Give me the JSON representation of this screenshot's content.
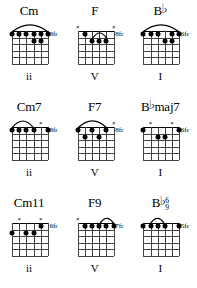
{
  "document": {
    "title": "Guitar chord chart - ii V I progressions in B-flat",
    "strings": 6,
    "frets": 5
  },
  "symbols": {
    "muted": "×",
    "open": "○",
    "flat": "♭",
    "fret_suffix": "fr"
  },
  "rows": [
    {
      "row_name": "triads",
      "chords": [
        {
          "name_root": "Cm",
          "name_flat": "",
          "name_suffix": "",
          "stack_top": "",
          "stack_bottom": "",
          "fret_label": "8fr",
          "numeral": "ii",
          "markers": [],
          "barre": {
            "from_string": 1,
            "to_string": 6,
            "fret": 1
          },
          "dots": [
            {
              "string": 1,
              "fret": 1
            },
            {
              "string": 2,
              "fret": 1
            },
            {
              "string": 3,
              "fret": 1
            },
            {
              "string": 4,
              "fret": 1
            },
            {
              "string": 5,
              "fret": 1
            },
            {
              "string": 6,
              "fret": 1
            },
            {
              "string": 4,
              "fret": 2
            },
            {
              "string": 5,
              "fret": 2
            }
          ]
        },
        {
          "name_root": "F",
          "name_flat": "",
          "name_suffix": "",
          "stack_top": "",
          "stack_bottom": "",
          "fret_label": "8fr",
          "numeral": "V",
          "markers": [
            {
              "string": 1,
              "type": "muted"
            },
            {
              "string": 6,
              "type": "muted"
            }
          ],
          "barre": {
            "from_string": 3,
            "to_string": 5,
            "fret": 2
          },
          "dots": [
            {
              "string": 2,
              "fret": 1
            },
            {
              "string": 3,
              "fret": 2
            },
            {
              "string": 4,
              "fret": 2
            },
            {
              "string": 5,
              "fret": 2
            }
          ]
        },
        {
          "name_root": "B",
          "name_flat": "♭",
          "name_suffix": "",
          "stack_top": "",
          "stack_bottom": "",
          "fret_label": "6fr",
          "numeral": "I",
          "markers": [],
          "barre": {
            "from_string": 1,
            "to_string": 6,
            "fret": 1
          },
          "dots": [
            {
              "string": 1,
              "fret": 1
            },
            {
              "string": 2,
              "fret": 1
            },
            {
              "string": 3,
              "fret": 1
            },
            {
              "string": 5,
              "fret": 1
            },
            {
              "string": 6,
              "fret": 1
            },
            {
              "string": 4,
              "fret": 2
            },
            {
              "string": 5,
              "fret": 2
            }
          ]
        }
      ]
    },
    {
      "row_name": "sevenths",
      "chords": [
        {
          "name_root": "Cm7",
          "name_flat": "",
          "name_suffix": "",
          "stack_top": "",
          "stack_bottom": "",
          "fret_label": "8fr",
          "numeral": "ii",
          "markers": [
            {
              "string": 5,
              "type": "muted"
            }
          ],
          "barre": {
            "from_string": 1,
            "to_string": 4,
            "fret": 1
          },
          "dots": [
            {
              "string": 1,
              "fret": 1
            },
            {
              "string": 2,
              "fret": 1
            },
            {
              "string": 3,
              "fret": 1
            },
            {
              "string": 4,
              "fret": 1
            },
            {
              "string": 6,
              "fret": 1
            }
          ]
        },
        {
          "name_root": "F7",
          "name_flat": "",
          "name_suffix": "",
          "stack_top": "",
          "stack_bottom": "",
          "fret_label": "8fr",
          "numeral": "V",
          "markers": [
            {
              "string": 6,
              "type": "muted"
            }
          ],
          "barre": {
            "from_string": 1,
            "to_string": 5,
            "fret": 1
          },
          "dots": [
            {
              "string": 1,
              "fret": 1
            },
            {
              "string": 3,
              "fret": 1
            },
            {
              "string": 5,
              "fret": 1
            },
            {
              "string": 2,
              "fret": 2
            },
            {
              "string": 4,
              "fret": 2
            }
          ]
        },
        {
          "name_root": "B",
          "name_flat": "♭",
          "name_suffix": "maj7",
          "stack_top": "",
          "stack_bottom": "",
          "fret_label": "6fr",
          "numeral": "I",
          "markers": [
            {
              "string": 2,
              "type": "muted"
            },
            {
              "string": 5,
              "type": "muted"
            }
          ],
          "barre": null,
          "dots": [
            {
              "string": 1,
              "fret": 1
            },
            {
              "string": 6,
              "fret": 1
            },
            {
              "string": 3,
              "fret": 2
            },
            {
              "string": 4,
              "fret": 2
            }
          ]
        }
      ]
    },
    {
      "row_name": "extensions",
      "chords": [
        {
          "name_root": "Cm11",
          "name_flat": "",
          "name_suffix": "",
          "stack_top": "",
          "stack_bottom": "",
          "fret_label": "6fr",
          "numeral": "ii",
          "markers": [
            {
              "string": 2,
              "type": "muted"
            },
            {
              "string": 5,
              "type": "muted"
            }
          ],
          "barre": null,
          "dots": [
            {
              "string": 5,
              "fret": 1
            },
            {
              "string": 1,
              "fret": 2
            },
            {
              "string": 3,
              "fret": 2
            },
            {
              "string": 4,
              "fret": 2
            }
          ]
        },
        {
          "name_root": "F9",
          "name_flat": "",
          "name_suffix": "",
          "stack_top": "",
          "stack_bottom": "",
          "fret_label": "7fr",
          "numeral": "V",
          "markers": [
            {
              "string": 1,
              "type": "muted"
            }
          ],
          "barre": {
            "from_string": 4,
            "to_string": 6,
            "fret": 1
          },
          "dots": [
            {
              "string": 2,
              "fret": 1
            },
            {
              "string": 3,
              "fret": 1
            },
            {
              "string": 4,
              "fret": 1
            },
            {
              "string": 5,
              "fret": 1
            },
            {
              "string": 6,
              "fret": 1
            }
          ]
        },
        {
          "name_root": "B",
          "name_flat": "♭",
          "name_suffix": "",
          "stack_top": "6",
          "stack_bottom": "9",
          "fret_label": "5fr",
          "numeral": "I",
          "markers": [],
          "barre": {
            "from_string": 2,
            "to_string": 4,
            "fret": 1
          },
          "dots": [
            {
              "string": 1,
              "fret": 1
            },
            {
              "string": 2,
              "fret": 1
            },
            {
              "string": 3,
              "fret": 1
            },
            {
              "string": 4,
              "fret": 1
            },
            {
              "string": 6,
              "fret": 1
            }
          ]
        }
      ]
    }
  ]
}
